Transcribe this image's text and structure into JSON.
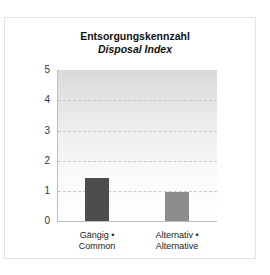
{
  "chart_data": {
    "type": "bar",
    "title": "Entsorgungskennzahl",
    "subtitle": "Disposal Index",
    "categories": [
      "Gängig • Common",
      "Alternativ • Alternative"
    ],
    "category_lines": [
      [
        "Gängig •",
        "Common"
      ],
      [
        "Alternativ •",
        "Alternative"
      ]
    ],
    "values": [
      1.43,
      0.97
    ],
    "bar_colors": [
      "#4d4d4d",
      "#8c8c8c"
    ],
    "xlabel": "",
    "ylabel": "",
    "ylim": [
      0,
      5
    ],
    "yticks": [
      "0",
      "1",
      "2",
      "3",
      "4",
      "5"
    ],
    "grid": true,
    "legend": null,
    "background_gradient": [
      "#d9d9d9",
      "#ffffff"
    ]
  }
}
